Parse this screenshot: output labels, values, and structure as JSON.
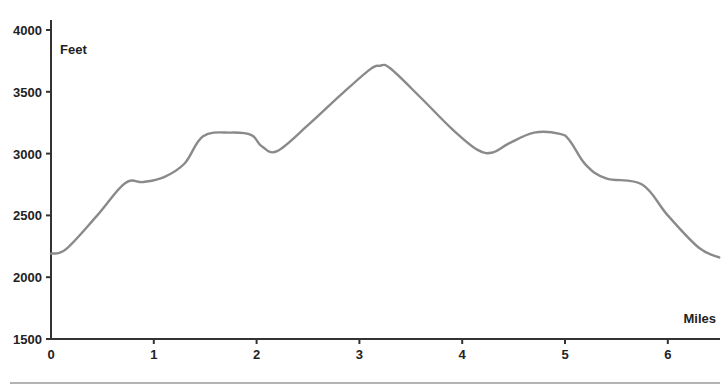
{
  "chart_data": {
    "type": "line",
    "title": "",
    "xlabel": "Miles",
    "ylabel": "Feet",
    "xlim": [
      0,
      6.5
    ],
    "ylim": [
      1500,
      4000
    ],
    "x_ticks": [
      0,
      1,
      2,
      3,
      4,
      5,
      6
    ],
    "y_ticks": [
      1500,
      2000,
      2500,
      3000,
      3500,
      4000
    ],
    "grid": false,
    "legend": null,
    "series": [
      {
        "name": "Elevation",
        "color": "#8a8a8a",
        "x": [
          0,
          0.15,
          0.45,
          0.72,
          0.9,
          1.1,
          1.3,
          1.48,
          1.75,
          1.95,
          2.05,
          2.2,
          2.5,
          2.8,
          3.1,
          3.2,
          3.3,
          3.6,
          3.9,
          4.15,
          4.3,
          4.45,
          4.7,
          4.95,
          5.05,
          5.2,
          5.4,
          5.75,
          6.0,
          6.3,
          6.5
        ],
        "y": [
          2190,
          2230,
          2500,
          2760,
          2770,
          2810,
          2920,
          3140,
          3170,
          3150,
          3060,
          3020,
          3230,
          3460,
          3680,
          3710,
          3690,
          3450,
          3200,
          3030,
          3010,
          3080,
          3170,
          3160,
          3100,
          2910,
          2800,
          2750,
          2500,
          2240,
          2160
        ]
      }
    ]
  },
  "axes": {
    "y_title": "Feet",
    "x_title": "Miles",
    "y_tick_labels": [
      "4000",
      "3500",
      "3000",
      "2500",
      "2000",
      "1500"
    ],
    "x_tick_labels": [
      "0",
      "1",
      "2",
      "3",
      "4",
      "5",
      "6"
    ]
  }
}
